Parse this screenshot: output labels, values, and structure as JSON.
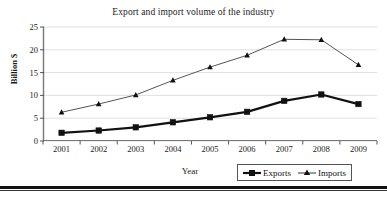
{
  "chart_data": {
    "type": "line",
    "title": "Export and import volume of the industry",
    "xlabel": "Year",
    "ylabel": "Billion $",
    "categories": [
      "2001",
      "2002",
      "2003",
      "2004",
      "2005",
      "2006",
      "2007",
      "2008",
      "2009"
    ],
    "ylim": [
      0,
      25
    ],
    "yticks": [
      0,
      5,
      10,
      15,
      20,
      25
    ],
    "ytick_labels": [
      "0",
      "5",
      "10",
      "15",
      "20",
      "25"
    ],
    "grid": true,
    "grid_axis": "y",
    "legend_position": "bottom-right",
    "series": [
      {
        "name": "Exports",
        "marker": "square",
        "color": "#111111",
        "line_width": 2.2,
        "values": [
          1.8,
          2.3,
          3.0,
          4.1,
          5.2,
          6.4,
          8.8,
          10.2,
          8.1
        ]
      },
      {
        "name": "Imports",
        "marker": "triangle",
        "color": "#555555",
        "line_width": 1.0,
        "values": [
          6.3,
          8.1,
          10.1,
          13.3,
          16.2,
          18.8,
          22.3,
          22.2,
          16.7
        ]
      }
    ]
  },
  "legend": {
    "items": [
      {
        "label": "Exports",
        "icon": "square-marker-icon"
      },
      {
        "label": "Imports",
        "icon": "triangle-marker-icon"
      }
    ]
  }
}
